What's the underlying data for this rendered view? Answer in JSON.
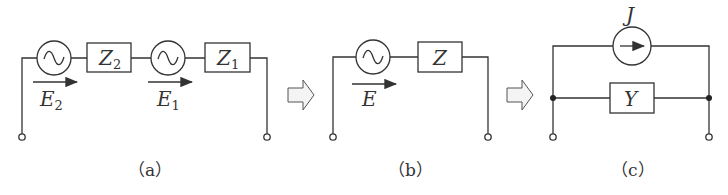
{
  "figure": {
    "panels": [
      {
        "caption": "（a）",
        "elements": {
          "source_1": {
            "label": "E",
            "subscript": "2"
          },
          "impedance_1": {
            "label": "Z",
            "subscript": "2"
          },
          "source_2": {
            "label": "E",
            "subscript": "1"
          },
          "impedance_2": {
            "label": "Z",
            "subscript": "1"
          }
        }
      },
      {
        "caption": "（b）",
        "elements": {
          "source": {
            "label": "E"
          },
          "impedance": {
            "label": "Z"
          }
        }
      },
      {
        "caption": "（c）",
        "elements": {
          "current_source": {
            "label": "J"
          },
          "admittance": {
            "label": "Y"
          }
        }
      }
    ],
    "transform_arrows": 2,
    "colors": {
      "line": "#333333",
      "arrow_fill": "#f4f4f4"
    }
  }
}
